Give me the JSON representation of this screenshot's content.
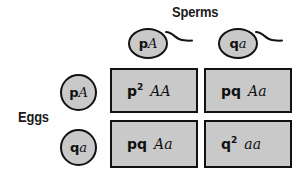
{
  "diagram": {
    "title_axis_top": "Sperms",
    "title_axis_left": "Eggs",
    "colors": {
      "cell_fill": "#c9c9c9",
      "cell_border": "#121212",
      "text": "#101010",
      "background": "#ffffff"
    }
  },
  "sperms": [
    {
      "frequency": "p",
      "allele": "A",
      "combined": "pA"
    },
    {
      "frequency": "q",
      "allele": "a",
      "combined": "qa"
    }
  ],
  "eggs": [
    {
      "frequency": "p",
      "allele": "A",
      "combined": "pA"
    },
    {
      "frequency": "q",
      "allele": "a",
      "combined": "qa"
    }
  ],
  "grid": {
    "rows": 2,
    "cols": 2,
    "cells": [
      {
        "id": "cell-00",
        "frequency": "p",
        "exponent": "2",
        "genotype": "AA",
        "text": "p2 AA"
      },
      {
        "id": "cell-01",
        "frequency": "pq",
        "exponent": "",
        "genotype": "Aa",
        "text": "pq Aa"
      },
      {
        "id": "cell-10",
        "frequency": "pq",
        "exponent": "",
        "genotype": "Aa",
        "text": "pq Aa"
      },
      {
        "id": "cell-11",
        "frequency": "q",
        "exponent": "2",
        "genotype": "aa",
        "text": "q2 aa"
      }
    ]
  }
}
